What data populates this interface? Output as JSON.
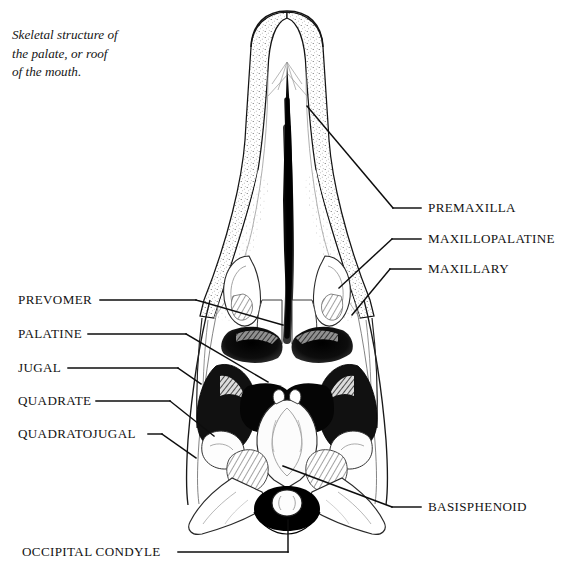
{
  "figure": {
    "caption_lines": [
      "Skeletal structure of",
      "the palate, or roof",
      "of the mouth."
    ],
    "ink_color": "#000000",
    "background_color": "#ffffff"
  },
  "labels_right": [
    {
      "id": "premaxilla",
      "text": "PREMAXILLA",
      "x": 428,
      "y": 208
    },
    {
      "id": "maxillopalatine",
      "text": "MAXILLOPALATINE",
      "x": 428,
      "y": 239
    },
    {
      "id": "maxillary",
      "text": "MAXILLARY",
      "x": 428,
      "y": 269
    },
    {
      "id": "basisphenoid",
      "text": "BASISPHENOID",
      "x": 428,
      "y": 507
    }
  ],
  "labels_left": [
    {
      "id": "prevomer",
      "text": "PREVOMER",
      "x": 18,
      "y": 300
    },
    {
      "id": "palatine",
      "text": "PALATINE",
      "x": 18,
      "y": 334
    },
    {
      "id": "jugal",
      "text": "JUGAL",
      "x": 18,
      "y": 368
    },
    {
      "id": "quadrate",
      "text": "QUADRATE",
      "x": 18,
      "y": 401
    },
    {
      "id": "quadratojugal",
      "text": "QUADRATOJUGAL",
      "x": 18,
      "y": 434
    },
    {
      "id": "occipital-condyle",
      "text": "OCCIPITAL CONDYLE",
      "x": 22,
      "y": 552
    }
  ]
}
